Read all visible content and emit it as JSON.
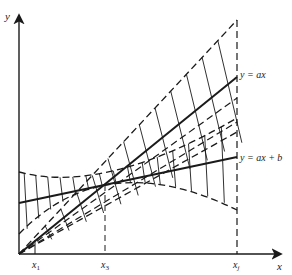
{
  "diagram": {
    "axes": {
      "x_label": "x",
      "y_label": "y"
    },
    "x_ticks": [
      {
        "id": "x1",
        "label": "x",
        "sub": "1"
      },
      {
        "id": "x3",
        "label": "x",
        "sub": "3"
      },
      {
        "id": "xj",
        "label": "x",
        "sub": "j"
      }
    ],
    "lines": [
      {
        "id": "line-ax",
        "label": "y = ax"
      },
      {
        "id": "line-ax-b",
        "label": "y = ax + b"
      }
    ],
    "colors": {
      "ink": "#1a1a1a",
      "background": "#ffffff"
    }
  }
}
